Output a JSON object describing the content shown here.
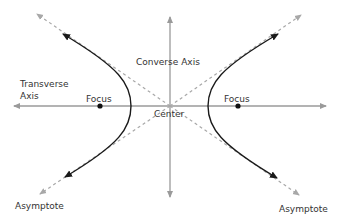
{
  "diagram": {
    "labels": {
      "transverse_axis_line1": "Transverse",
      "transverse_axis_line2": "Axis",
      "converse_axis": "Converse Axis",
      "center": "Center",
      "focus_left": "Focus",
      "focus_right": "Focus",
      "asymptote_left": "Asymptote",
      "asymptote_right": "Asymptote"
    },
    "colors": {
      "axis": "#9a9a9a",
      "asymptote": "#a8a8a8",
      "curve": "#1a1a1a",
      "focus": "#111111",
      "text": "#333333"
    }
  }
}
